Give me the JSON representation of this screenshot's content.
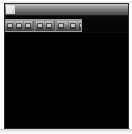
{
  "window": {
    "title": "",
    "app_icon": "application-icon",
    "background_color": "#000000",
    "frame_color": "#2a2a2a",
    "titlebar_gradient_top": "#c9c9c9",
    "titlebar_gradient_bottom": "#474747"
  },
  "titlebar": {
    "icon_name": "application-icon",
    "title_text": "",
    "minimize_label": "",
    "maximize_label": "",
    "close_label": ""
  },
  "toolbar": {
    "background_color": "#707070",
    "items": [
      {
        "name": "toolbar-button-1",
        "label": ""
      },
      {
        "name": "toolbar-button-2",
        "label": ""
      },
      {
        "name": "toolbar-button-3",
        "label": ""
      },
      {
        "name": "toolbar-separator-1",
        "label": ""
      },
      {
        "name": "toolbar-button-4",
        "label": ""
      },
      {
        "name": "toolbar-button-5",
        "label": ""
      },
      {
        "name": "toolbar-separator-2",
        "label": ""
      },
      {
        "name": "toolbar-button-6",
        "label": ""
      },
      {
        "name": "toolbar-button-7",
        "label": ""
      },
      {
        "name": "toolbar-button-8",
        "label": ""
      },
      {
        "name": "toolbar-separator-3",
        "label": ""
      },
      {
        "name": "toolbar-button-9",
        "label": ""
      },
      {
        "name": "toolbar-button-10",
        "label": ""
      }
    ]
  },
  "content": {
    "background_color": "#000000",
    "text": ""
  }
}
